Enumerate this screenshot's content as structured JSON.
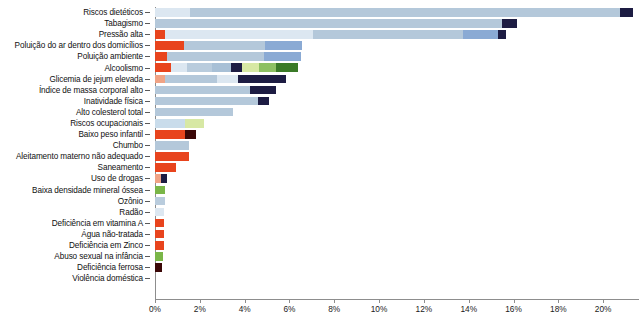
{
  "chart_data": {
    "type": "bar",
    "orientation": "horizontal",
    "stacked": true,
    "title": "",
    "subtitle": "",
    "xlabel": "",
    "ylabel": "",
    "xlim": [
      0,
      21.6
    ],
    "grid": false,
    "legend": "none",
    "xticks": [
      "0%",
      "2%",
      "4%",
      "6%",
      "8%",
      "10%",
      "12%",
      "14%",
      "16%",
      "18%",
      "20%"
    ],
    "xtick_values": [
      0,
      2,
      4,
      6,
      8,
      10,
      12,
      14,
      16,
      18,
      20
    ],
    "categories": [
      "Riscos dietéticos",
      "Tabagismo",
      "Pressão alta",
      "Poluição do ar dentro dos domicílios",
      "Poluição ambiente",
      "Alcoolismo",
      "Glicemia de jejum elevada",
      "Índice de massa corporal alto",
      "Inatividade física",
      "Alto colesterol total",
      "Riscos ocupacionais",
      "Baixo peso infantil",
      "Chumbo",
      "Aleitamento materno não adequado",
      "Saneamento",
      "Uso de drogas",
      "Baixa densidade mineral óssea",
      "Ozônio",
      "Radão",
      "Deficiência em vitamina A",
      "Água não-tratada",
      "Deficiência em Zinco",
      "Abuso sexual na infância",
      "Deficiência ferrosa",
      "Violência doméstica"
    ],
    "totals": [
      21.35,
      16.15,
      15.65,
      6.55,
      6.5,
      6.4,
      5.85,
      5.4,
      5.1,
      3.5,
      2.2,
      1.85,
      1.5,
      1.5,
      0.95,
      0.55,
      0.45,
      0.45,
      0.42,
      0.4,
      0.38,
      0.38,
      0.35,
      0.3,
      0.0
    ],
    "colors": {
      "red_orange": "#e8441d",
      "salmon": "#f0a385",
      "pale_blue": "#dae5ef",
      "light_blue_gray": "#b9ccdd",
      "steel_blue": "#a8c0d6",
      "medium_blue": "#8aaad4",
      "navy": "#1d1c43",
      "dark_maroon": "#3b0707",
      "pale_green": "#d7e8a4",
      "green": "#7ab648",
      "dark_green": "#3a7a27",
      "mid_green": "#8dc063"
    },
    "series": [
      {
        "category": "Riscos dietéticos",
        "segments": [
          {
            "color": "#dce7f1",
            "value": 1.55
          },
          {
            "color": "#b4c8da",
            "value": 19.2
          },
          {
            "color": "#1d1c43",
            "value": 0.6
          }
        ]
      },
      {
        "category": "Tabagismo",
        "segments": [
          {
            "color": "#b4c8da",
            "value": 15.5
          },
          {
            "color": "#1d1c43",
            "value": 0.65
          }
        ]
      },
      {
        "category": "Pressão alta",
        "segments": [
          {
            "color": "#e8441d",
            "value": 0.45
          },
          {
            "color": "#dce7f1",
            "value": 6.6
          },
          {
            "color": "#b4c8da",
            "value": 6.7
          },
          {
            "color": "#8aaad4",
            "value": 1.55
          },
          {
            "color": "#1d1c43",
            "value": 0.35
          }
        ]
      },
      {
        "category": "Poluição do ar dentro dos domicílios",
        "segments": [
          {
            "color": "#e8441d",
            "value": 1.3
          },
          {
            "color": "#b4c8da",
            "value": 3.6
          },
          {
            "color": "#8aaad4",
            "value": 1.65
          }
        ]
      },
      {
        "category": "Poluição ambiente",
        "segments": [
          {
            "color": "#e8441d",
            "value": 0.55
          },
          {
            "color": "#b4c8da",
            "value": 4.3
          },
          {
            "color": "#8aaad4",
            "value": 1.65
          }
        ]
      },
      {
        "category": "Alcoolismo",
        "segments": [
          {
            "color": "#e8441d",
            "value": 0.7
          },
          {
            "color": "#dce7f1",
            "value": 0.75
          },
          {
            "color": "#b9ccdd",
            "value": 1.1
          },
          {
            "color": "#a8c0d6",
            "value": 0.85
          },
          {
            "color": "#1d1c43",
            "value": 0.5
          },
          {
            "color": "#d7e8a4",
            "value": 0.75
          },
          {
            "color": "#8dc063",
            "value": 0.75
          },
          {
            "color": "#3a7a27",
            "value": 1.0
          }
        ]
      },
      {
        "category": "Glicemia de jejum elevada",
        "segments": [
          {
            "color": "#f0a385",
            "value": 0.45
          },
          {
            "color": "#b4c8da",
            "value": 2.3
          },
          {
            "color": "#dce7f1",
            "value": 0.95
          },
          {
            "color": "#1d1c43",
            "value": 2.15
          }
        ]
      },
      {
        "category": "Índice de massa corporal alto",
        "segments": [
          {
            "color": "#b4c8da",
            "value": 4.25
          },
          {
            "color": "#1d1c43",
            "value": 1.15
          }
        ]
      },
      {
        "category": "Inatividade física",
        "segments": [
          {
            "color": "#b4c8da",
            "value": 4.6
          },
          {
            "color": "#1d1c43",
            "value": 0.5
          }
        ]
      },
      {
        "category": "Alto colesterol total",
        "segments": [
          {
            "color": "#b4c8da",
            "value": 3.5
          }
        ]
      },
      {
        "category": "Riscos ocupacionais",
        "segments": [
          {
            "color": "#c9dceb",
            "value": 1.35
          },
          {
            "color": "#d7e8a4",
            "value": 0.85
          }
        ]
      },
      {
        "category": "Baixo peso infantil",
        "segments": [
          {
            "color": "#e8441d",
            "value": 1.35
          },
          {
            "color": "#3b0707",
            "value": 0.5
          }
        ]
      },
      {
        "category": "Chumbo",
        "segments": [
          {
            "color": "#b4c8da",
            "value": 1.5
          }
        ]
      },
      {
        "category": "Aleitamento materno não adequado",
        "segments": [
          {
            "color": "#e8441d",
            "value": 1.5
          }
        ]
      },
      {
        "category": "Saneamento",
        "segments": [
          {
            "color": "#e8441d",
            "value": 0.95
          }
        ]
      },
      {
        "category": "Uso de drogas",
        "segments": [
          {
            "color": "#f0a385",
            "value": 0.25
          },
          {
            "color": "#1d1c43",
            "value": 0.3
          }
        ]
      },
      {
        "category": "Baixa densidade mineral óssea",
        "segments": [
          {
            "color": "#7ab648",
            "value": 0.45
          }
        ]
      },
      {
        "category": "Ozônio",
        "segments": [
          {
            "color": "#b9ccdd",
            "value": 0.45
          }
        ]
      },
      {
        "category": "Radão",
        "segments": [
          {
            "color": "#dce7f1",
            "value": 0.42
          }
        ]
      },
      {
        "category": "Deficiência em vitamina A",
        "segments": [
          {
            "color": "#e8441d",
            "value": 0.4
          }
        ]
      },
      {
        "category": "Água não-tratada",
        "segments": [
          {
            "color": "#e8441d",
            "value": 0.38
          }
        ]
      },
      {
        "category": "Deficiência em Zinco",
        "segments": [
          {
            "color": "#e8441d",
            "value": 0.38
          }
        ]
      },
      {
        "category": "Abuso sexual na infância",
        "segments": [
          {
            "color": "#7ab648",
            "value": 0.35
          }
        ]
      },
      {
        "category": "Deficiência ferrosa",
        "segments": [
          {
            "color": "#3b0707",
            "value": 0.3
          }
        ]
      },
      {
        "category": "Violência doméstica",
        "segments": []
      }
    ]
  }
}
